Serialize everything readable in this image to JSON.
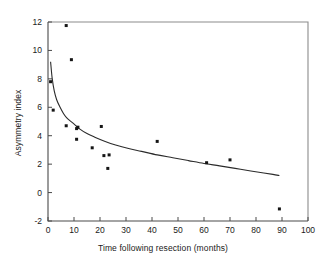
{
  "chart_data": {
    "type": "scatter",
    "title": "",
    "xlabel": "Time following resection (months)",
    "ylabel": "Asymmetry index",
    "xlim": [
      0,
      100
    ],
    "ylim": [
      -2,
      12
    ],
    "xticks": [
      0,
      10,
      20,
      30,
      40,
      50,
      60,
      70,
      80,
      90,
      100
    ],
    "yticks": [
      -2,
      0,
      2,
      4,
      6,
      8,
      10,
      12
    ],
    "grid": false,
    "legend": null,
    "marker": "filled-square-dot",
    "marker_color": "#151515",
    "curve_color": "#2b2b2b",
    "points": [
      {
        "x": 1.0,
        "y": 7.8
      },
      {
        "x": 2.0,
        "y": 5.8
      },
      {
        "x": 7.0,
        "y": 11.75
      },
      {
        "x": 7.0,
        "y": 4.7
      },
      {
        "x": 9.0,
        "y": 9.35
      },
      {
        "x": 11.0,
        "y": 4.5
      },
      {
        "x": 11.5,
        "y": 4.6
      },
      {
        "x": 11.0,
        "y": 3.75
      },
      {
        "x": 17.0,
        "y": 3.15
      },
      {
        "x": 20.5,
        "y": 4.65
      },
      {
        "x": 21.5,
        "y": 2.6
      },
      {
        "x": 23.5,
        "y": 2.65
      },
      {
        "x": 23.0,
        "y": 1.7
      },
      {
        "x": 42.0,
        "y": 3.6
      },
      {
        "x": 61.0,
        "y": 2.1
      },
      {
        "x": 70.0,
        "y": 2.3
      },
      {
        "x": 89.0,
        "y": -1.15
      }
    ],
    "fit_curve": {
      "description": "decaying fitted trend line",
      "points": [
        {
          "x": 1.0,
          "y": 9.2
        },
        {
          "x": 1.6,
          "y": 8.05
        },
        {
          "x": 2.4,
          "y": 7.15
        },
        {
          "x": 3.3,
          "y": 6.55
        },
        {
          "x": 4.5,
          "y": 6.05
        },
        {
          "x": 6.0,
          "y": 5.55
        },
        {
          "x": 7.5,
          "y": 5.2
        },
        {
          "x": 9.5,
          "y": 4.9
        },
        {
          "x": 12.0,
          "y": 4.5
        },
        {
          "x": 15.0,
          "y": 4.15
        },
        {
          "x": 18.0,
          "y": 3.9
        },
        {
          "x": 22.0,
          "y": 3.6
        },
        {
          "x": 26.0,
          "y": 3.35
        },
        {
          "x": 31.0,
          "y": 3.1
        },
        {
          "x": 36.0,
          "y": 2.9
        },
        {
          "x": 42.0,
          "y": 2.65
        },
        {
          "x": 48.0,
          "y": 2.45
        },
        {
          "x": 54.0,
          "y": 2.25
        },
        {
          "x": 60.0,
          "y": 2.05
        },
        {
          "x": 66.0,
          "y": 1.88
        },
        {
          "x": 72.0,
          "y": 1.7
        },
        {
          "x": 78.0,
          "y": 1.52
        },
        {
          "x": 83.0,
          "y": 1.38
        },
        {
          "x": 86.5,
          "y": 1.28
        },
        {
          "x": 89.0,
          "y": 1.2
        }
      ]
    }
  }
}
